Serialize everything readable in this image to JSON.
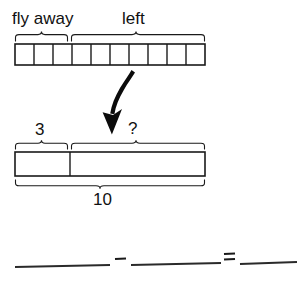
{
  "worksheet": {
    "type": "tape-diagram-subtraction-worksheet",
    "top_bar": {
      "total_cells": 10,
      "part_labels": [
        {
          "text": "fly away",
          "cells": 3
        },
        {
          "text": "left",
          "cells": 7
        }
      ]
    },
    "arrow": {
      "icon": "curved-down-arrow",
      "direction": "down"
    },
    "bottom_bar": {
      "parts": [
        {
          "label": "3",
          "value": 3
        },
        {
          "label": "?",
          "value": null
        }
      ],
      "total_label": "10",
      "total_value": 10
    },
    "equation": {
      "blank_1": "",
      "operator_minus": "−",
      "blank_2": "",
      "operator_equals": "=",
      "blank_3": ""
    },
    "colors": {
      "ink": "#111111",
      "line": "#1a1a1a",
      "paper": "#ffffff"
    }
  }
}
